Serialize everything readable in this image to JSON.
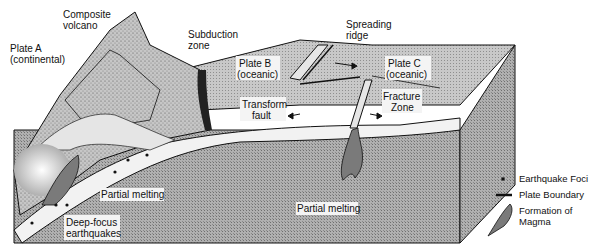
{
  "diagram": {
    "labels": {
      "plate_a": [
        "Plate A",
        "(continental)"
      ],
      "composite_volcano": [
        "Composite",
        "volcano"
      ],
      "subduction_zone": [
        "Subduction",
        "zone"
      ],
      "spreading_ridge": [
        "Spreading",
        "ridge"
      ],
      "plate_b": [
        "Plate B",
        "(oceanic)"
      ],
      "plate_c": [
        "Plate C",
        "(oceanic)"
      ],
      "transform_fault": [
        "Transform",
        "fault"
      ],
      "fracture_zone": [
        "Fracture",
        "Zone"
      ],
      "partial_melting_left": [
        "Partial melting"
      ],
      "partial_melting_center": [
        "Partial melting"
      ],
      "deep_focus": [
        "Deep-focus",
        "earthquakes"
      ]
    },
    "legend": [
      {
        "icon": "earthquake-foci-dot",
        "label": "Earthquake Foci"
      },
      {
        "icon": "plate-boundary-line",
        "label": "Plate Boundary"
      },
      {
        "icon": "magma-formation-shape",
        "label": "Formation of Magma"
      }
    ],
    "colors": {
      "ink": "#111111",
      "block_fill": "#a9a9a9",
      "surface_fill": "#c4c4c4",
      "slab_fill": "#f2f2f2",
      "mountain_fill": "#b8b8b8"
    }
  }
}
